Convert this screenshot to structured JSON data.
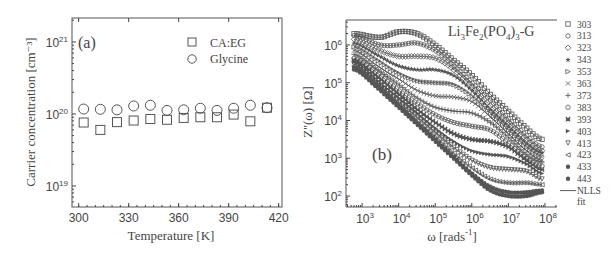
{
  "chart_data": [
    {
      "type": "scatter",
      "panel_label": "(a)",
      "title": "",
      "xlabel": "Temperature [K]",
      "ylabel": "Carrier concentration [cm⁻³]",
      "xscale": "linear",
      "yscale": "log",
      "xlim": [
        296,
        422
      ],
      "ylim": [
        5.1e+18,
        2.15e+21
      ],
      "xticks": [
        300,
        330,
        360,
        390,
        420
      ],
      "xtick_labels": [
        "300",
        "330",
        "360",
        "390",
        "420"
      ],
      "yticks": [
        1e+19,
        1e+20,
        1e+21
      ],
      "ytick_labels": [
        {
          "base": "10",
          "exp": "19"
        },
        {
          "base": "10",
          "exp": "20"
        },
        {
          "base": "10",
          "exp": "21"
        }
      ],
      "grid": false,
      "legend_position": "top-right",
      "series": [
        {
          "name": "CA:EG",
          "marker": "square",
          "x": [
            303,
            313,
            323,
            333,
            343,
            353,
            363,
            373,
            383,
            393,
            403,
            413
          ],
          "y": [
            7.6e+19,
            6e+19,
            7.7e+19,
            8.1e+19,
            8.5e+19,
            8.3e+19,
            8.8e+19,
            9e+19,
            9e+19,
            9.8e+19,
            7.9e+19,
            1.22e+20
          ]
        },
        {
          "name": "Glycine",
          "marker": "circle",
          "x": [
            303,
            313,
            323,
            333,
            343,
            353,
            363,
            373,
            383,
            393,
            403,
            413
          ],
          "y": [
            1.17e+20,
            1.16e+20,
            1.14e+20,
            1.29e+20,
            1.32e+20,
            1.12e+20,
            1.14e+20,
            1.2e+20,
            1.12e+20,
            1.2e+20,
            1.32e+20,
            1.22e+20
          ]
        }
      ]
    },
    {
      "type": "line",
      "panel_label": "(b)",
      "title": "Li3Fe2(PO4)3-G",
      "title_parts": [
        {
          "t": "Li",
          "sub": false
        },
        {
          "t": "3",
          "sub": true
        },
        {
          "t": "Fe",
          "sub": false
        },
        {
          "t": "2",
          "sub": true
        },
        {
          "t": "(PO",
          "sub": false
        },
        {
          "t": "4",
          "sub": true
        },
        {
          "t": ")",
          "sub": false
        },
        {
          "t": "3",
          "sub": true
        },
        {
          "t": "-G",
          "sub": false
        }
      ],
      "xlabel": "ω [rads⁻¹]",
      "xlabel_parts": {
        "main": "ω [rads",
        "sup": "-1",
        "end": "]"
      },
      "ylabel": "Z''(ω) [Ω]",
      "xscale": "log",
      "yscale": "log",
      "xlim_log10": [
        2.56,
        8.33
      ],
      "ylim_log10": [
        1.71,
        6.66
      ],
      "xticks_log10": [
        3,
        4,
        5,
        6,
        7,
        8
      ],
      "yticks_log10": [
        2,
        3,
        4,
        5,
        6
      ],
      "tick_base": "10",
      "grid": false,
      "legend_position": "right-outside",
      "fit_label": "NLLS fit",
      "fit_label_lines": [
        "NLLS",
        "fit"
      ],
      "point_format": "[log10(ω), log10(Z'')]",
      "series": [
        {
          "name": "303",
          "marker": "square",
          "points": [
            [
              2.8,
              6.3
            ],
            [
              3.5,
              6.2
            ],
            [
              4,
              6.35
            ],
            [
              4.5,
              6.3
            ],
            [
              5,
              6.0
            ],
            [
              5.5,
              5.6
            ],
            [
              6,
              5.2
            ],
            [
              6.5,
              4.7
            ],
            [
              7,
              4.25
            ],
            [
              7.5,
              3.8
            ],
            [
              7.9,
              3.5
            ]
          ]
        },
        {
          "name": "313",
          "marker": "circle",
          "points": [
            [
              2.8,
              6.25
            ],
            [
              3.5,
              6.0
            ],
            [
              4,
              6.0
            ],
            [
              4.5,
              6.05
            ],
            [
              5,
              5.85
            ],
            [
              5.5,
              5.45
            ],
            [
              6,
              5.0
            ],
            [
              6.5,
              4.55
            ],
            [
              7,
              4.05
            ],
            [
              7.5,
              3.6
            ],
            [
              7.9,
              3.3
            ]
          ]
        },
        {
          "name": "323",
          "marker": "diamond",
          "points": [
            [
              2.8,
              6.15
            ],
            [
              3.5,
              5.85
            ],
            [
              4,
              5.7
            ],
            [
              4.5,
              5.7
            ],
            [
              5,
              5.65
            ],
            [
              5.5,
              5.35
            ],
            [
              6,
              4.9
            ],
            [
              6.5,
              4.4
            ],
            [
              7,
              3.95
            ],
            [
              7.5,
              3.5
            ],
            [
              7.9,
              3.2
            ]
          ]
        },
        {
          "name": "343",
          "marker": "star",
          "points": [
            [
              2.8,
              6.05
            ],
            [
              3.5,
              5.7
            ],
            [
              4,
              5.45
            ],
            [
              4.5,
              5.35
            ],
            [
              5,
              5.35
            ],
            [
              5.5,
              5.2
            ],
            [
              6,
              4.8
            ],
            [
              6.5,
              4.3
            ],
            [
              7,
              3.85
            ],
            [
              7.5,
              3.4
            ],
            [
              7.9,
              3.15
            ]
          ]
        },
        {
          "name": "353",
          "marker": "triangle-right",
          "points": [
            [
              2.8,
              5.95
            ],
            [
              3.5,
              5.55
            ],
            [
              4,
              5.25
            ],
            [
              4.5,
              5.05
            ],
            [
              5,
              5.0
            ],
            [
              5.5,
              4.95
            ],
            [
              6,
              4.65
            ],
            [
              6.5,
              4.2
            ],
            [
              7,
              3.75
            ],
            [
              7.5,
              3.3
            ],
            [
              7.9,
              3.05
            ]
          ]
        },
        {
          "name": "363",
          "marker": "cross",
          "points": [
            [
              2.8,
              5.85
            ],
            [
              3.5,
              5.4
            ],
            [
              4,
              5.1
            ],
            [
              4.5,
              4.8
            ],
            [
              5,
              4.65
            ],
            [
              5.5,
              4.62
            ],
            [
              6,
              4.5
            ],
            [
              6.5,
              4.1
            ],
            [
              7,
              3.65
            ],
            [
              7.5,
              3.2
            ],
            [
              7.9,
              2.95
            ]
          ]
        },
        {
          "name": "373",
          "marker": "plus",
          "points": [
            [
              2.8,
              5.75
            ],
            [
              3.5,
              5.3
            ],
            [
              4,
              4.95
            ],
            [
              4.5,
              4.6
            ],
            [
              5,
              4.35
            ],
            [
              5.5,
              4.25
            ],
            [
              6,
              4.2
            ],
            [
              6.5,
              3.95
            ],
            [
              7,
              3.55
            ],
            [
              7.5,
              3.1
            ],
            [
              7.9,
              2.9
            ]
          ]
        },
        {
          "name": "383",
          "marker": "circle",
          "points": [
            [
              2.8,
              5.65
            ],
            [
              3.5,
              5.2
            ],
            [
              4,
              4.8
            ],
            [
              4.5,
              4.45
            ],
            [
              5,
              4.15
            ],
            [
              5.5,
              3.95
            ],
            [
              6,
              3.85
            ],
            [
              6.5,
              3.75
            ],
            [
              7,
              3.4
            ],
            [
              7.5,
              3.0
            ],
            [
              7.9,
              2.8
            ]
          ]
        },
        {
          "name": "393",
          "marker": "asterisk-square",
          "points": [
            [
              2.8,
              5.6
            ],
            [
              3.5,
              5.1
            ],
            [
              4,
              4.7
            ],
            [
              4.5,
              4.3
            ],
            [
              5,
              3.95
            ],
            [
              5.5,
              3.65
            ],
            [
              6,
              3.5
            ],
            [
              6.5,
              3.45
            ],
            [
              7,
              3.3
            ],
            [
              7.5,
              2.95
            ],
            [
              7.9,
              2.7
            ]
          ]
        },
        {
          "name": "403",
          "marker": "triangle-right-filled",
          "points": [
            [
              2.8,
              5.55
            ],
            [
              3.5,
              5.0
            ],
            [
              4,
              4.6
            ],
            [
              4.5,
              4.2
            ],
            [
              5,
              3.8
            ],
            [
              5.5,
              3.45
            ],
            [
              6,
              3.2
            ],
            [
              6.5,
              3.1
            ],
            [
              7,
              3.05
            ],
            [
              7.5,
              2.85
            ],
            [
              7.9,
              2.6
            ]
          ]
        },
        {
          "name": "413",
          "marker": "triangle-down",
          "points": [
            [
              2.8,
              5.5
            ],
            [
              3.5,
              4.95
            ],
            [
              4,
              4.5
            ],
            [
              4.5,
              4.1
            ],
            [
              5,
              3.7
            ],
            [
              5.5,
              3.3
            ],
            [
              6,
              2.95
            ],
            [
              6.5,
              2.75
            ],
            [
              7,
              2.7
            ],
            [
              7.5,
              2.65
            ],
            [
              7.9,
              2.45
            ]
          ]
        },
        {
          "name": "423",
          "marker": "triangle-left",
          "points": [
            [
              2.8,
              5.45
            ],
            [
              3.5,
              4.9
            ],
            [
              4,
              4.45
            ],
            [
              4.5,
              4.0
            ],
            [
              5,
              3.6
            ],
            [
              5.5,
              3.15
            ],
            [
              6,
              2.75
            ],
            [
              6.5,
              2.45
            ],
            [
              7,
              2.35
            ],
            [
              7.5,
              2.35
            ],
            [
              7.9,
              2.3
            ]
          ]
        },
        {
          "name": "433",
          "marker": "circle-plus",
          "points": [
            [
              2.8,
              5.4
            ],
            [
              3.5,
              4.85
            ],
            [
              4,
              4.4
            ],
            [
              4.5,
              3.95
            ],
            [
              5,
              3.5
            ],
            [
              5.5,
              3.05
            ],
            [
              6,
              2.6
            ],
            [
              6.5,
              2.25
            ],
            [
              7,
              2.1
            ],
            [
              7.5,
              2.1
            ],
            [
              7.9,
              2.15
            ]
          ]
        },
        {
          "name": "443",
          "marker": "circle-vline",
          "points": [
            [
              2.8,
              5.35
            ],
            [
              3.5,
              4.8
            ],
            [
              4,
              4.35
            ],
            [
              4.5,
              3.9
            ],
            [
              5,
              3.45
            ],
            [
              5.5,
              3.0
            ],
            [
              6,
              2.55
            ],
            [
              6.5,
              2.15
            ],
            [
              7,
              2.0
            ],
            [
              7.5,
              2.0
            ],
            [
              7.9,
              2.1
            ]
          ]
        }
      ]
    }
  ],
  "colors": {
    "ink": "#444444",
    "marker": "#555555",
    "background": "#ffffff"
  }
}
